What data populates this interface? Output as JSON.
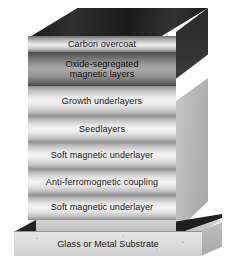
{
  "figure": {
    "colors": {
      "top_face": "#1b1b1b",
      "side_face_dark": "#2f2f2f",
      "side_face_light": "#b6b6b6",
      "layer_light": "#e6e6e6",
      "layer_dark": "#9a9a9a",
      "substrate": "#dcdcdc",
      "shadow": "#232323",
      "text": "#141414"
    }
  },
  "stack": {
    "layers": [
      {
        "id": "carbon-overcoat",
        "label": "Carbon overcoat",
        "shade": "carbon",
        "height": 16
      },
      {
        "id": "oxide-segregated",
        "label": "Oxide-segregated\nmagnetic layers",
        "shade": "dark",
        "height": 34
      },
      {
        "id": "growth-underlayers",
        "label": "Growth underlayers",
        "shade": "light",
        "height": 30
      },
      {
        "id": "seedlayers",
        "label": "Seedlayers",
        "shade": "light",
        "height": 26
      },
      {
        "id": "soft-magnetic-underlayer-upper",
        "label": "Soft magnetic underlayer",
        "shade": "light",
        "height": 27
      },
      {
        "id": "anti-ferromagnetic-coupling",
        "label": "Anti-ferromognetic coupling",
        "shade": "light",
        "height": 26
      },
      {
        "id": "soft-magnetic-underlayer-lower",
        "label": "Soft magnetic underlayer",
        "shade": "light",
        "height": 25
      }
    ]
  },
  "substrate": {
    "label": "Glass or Metal Substrate"
  }
}
